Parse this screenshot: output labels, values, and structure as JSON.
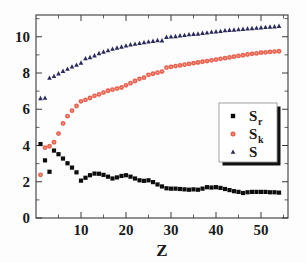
{
  "chart_data": {
    "type": "scatter",
    "title": "",
    "xlabel": "Z",
    "ylabel": "",
    "xlim": [
      0,
      56
    ],
    "ylim": [
      0,
      11.2
    ],
    "xticks": [
      10,
      20,
      30,
      40,
      50
    ],
    "yticks": [
      0,
      2,
      4,
      6,
      8,
      10
    ],
    "xtick_labels": [
      "10",
      "20",
      "30",
      "40",
      "50"
    ],
    "ytick_labels": [
      "0",
      "2",
      "4",
      "6",
      "8",
      "10"
    ],
    "grid": false,
    "legend_position": "center-right",
    "series": [
      {
        "name": "S_r",
        "label": "S",
        "sublabel": "r",
        "marker": "square",
        "color": "#0d0d0d",
        "x": [
          1,
          2,
          3,
          4,
          5,
          6,
          7,
          8,
          9,
          10,
          11,
          12,
          13,
          14,
          15,
          16,
          17,
          18,
          19,
          20,
          21,
          22,
          23,
          24,
          25,
          26,
          27,
          28,
          29,
          30,
          31,
          32,
          33,
          34,
          35,
          36,
          37,
          38,
          39,
          40,
          41,
          42,
          43,
          44,
          45,
          46,
          47,
          48,
          49,
          50,
          51,
          52,
          53,
          54
        ],
        "values": [
          4.08,
          3.18,
          2.55,
          3.72,
          3.52,
          3.28,
          3.02,
          2.78,
          2.52,
          2.06,
          2.22,
          2.36,
          2.45,
          2.44,
          2.38,
          2.28,
          2.18,
          2.24,
          2.32,
          2.36,
          2.28,
          2.18,
          2.08,
          2.05,
          2.08,
          1.98,
          1.85,
          1.74,
          1.64,
          1.62,
          1.62,
          1.6,
          1.58,
          1.56,
          1.58,
          1.56,
          1.62,
          1.7,
          1.68,
          1.7,
          1.66,
          1.6,
          1.54,
          1.48,
          1.44,
          1.38,
          1.42,
          1.44,
          1.44,
          1.44,
          1.44,
          1.42,
          1.42,
          1.4
        ]
      },
      {
        "name": "S_k",
        "label": "S",
        "sublabel": "k",
        "marker": "circle",
        "color": "#e8604c",
        "x": [
          1,
          2,
          3,
          4,
          5,
          6,
          7,
          8,
          9,
          10,
          11,
          12,
          13,
          14,
          15,
          16,
          17,
          18,
          19,
          20,
          21,
          22,
          23,
          24,
          25,
          26,
          27,
          28,
          29,
          30,
          31,
          32,
          33,
          34,
          35,
          36,
          37,
          38,
          39,
          40,
          41,
          42,
          43,
          44,
          45,
          46,
          47,
          48,
          49,
          50,
          51,
          52,
          53,
          54
        ],
        "values": [
          2.38,
          3.88,
          3.96,
          4.18,
          4.66,
          5.22,
          5.62,
          5.92,
          6.18,
          6.44,
          6.52,
          6.62,
          6.74,
          6.82,
          6.92,
          7.02,
          7.08,
          7.14,
          7.2,
          7.32,
          7.44,
          7.56,
          7.68,
          7.74,
          7.9,
          7.96,
          8.02,
          8.08,
          8.3,
          8.34,
          8.38,
          8.42,
          8.46,
          8.5,
          8.54,
          8.58,
          8.62,
          8.66,
          8.7,
          8.74,
          8.78,
          8.82,
          8.86,
          8.9,
          8.94,
          8.98,
          9.02,
          9.06,
          9.08,
          9.12,
          9.14,
          9.16,
          9.18,
          9.2
        ]
      },
      {
        "name": "S",
        "label": "S",
        "sublabel": "",
        "marker": "triangle",
        "color": "#2a2a5c",
        "x": [
          1,
          2,
          3,
          4,
          5,
          6,
          7,
          8,
          9,
          10,
          11,
          12,
          13,
          14,
          15,
          16,
          17,
          18,
          19,
          20,
          21,
          22,
          23,
          24,
          25,
          26,
          27,
          28,
          29,
          30,
          31,
          32,
          33,
          34,
          35,
          36,
          37,
          38,
          39,
          40,
          41,
          42,
          43,
          44,
          45,
          46,
          47,
          48,
          49,
          50,
          51,
          52,
          53,
          54
        ],
        "values": [
          6.6,
          6.62,
          7.72,
          7.82,
          7.96,
          8.1,
          8.22,
          8.34,
          8.44,
          8.56,
          8.8,
          8.86,
          8.96,
          9.08,
          9.16,
          9.24,
          9.32,
          9.38,
          9.44,
          9.5,
          9.56,
          9.6,
          9.64,
          9.68,
          9.72,
          9.76,
          9.8,
          9.78,
          9.98,
          10.0,
          10.02,
          10.06,
          10.08,
          10.12,
          10.14,
          10.16,
          10.2,
          10.22,
          10.26,
          10.28,
          10.3,
          10.34,
          10.36,
          10.38,
          10.4,
          10.42,
          10.44,
          10.46,
          10.48,
          10.5,
          10.52,
          10.54,
          10.56,
          10.58
        ]
      }
    ]
  },
  "legend": {
    "entries": [
      {
        "label": "S",
        "sublabel": "r",
        "marker": "square",
        "color": "#0d0d0d"
      },
      {
        "label": "S",
        "sublabel": "k",
        "marker": "circle",
        "color": "#e8604c"
      },
      {
        "label": "S",
        "sublabel": "",
        "marker": "triangle",
        "color": "#2a2a5c"
      }
    ]
  },
  "colors": {
    "series_sr": "#0d0d0d",
    "series_sk": "#e8604c",
    "series_s": "#2a2a5c",
    "axis": "#3a3a3a",
    "background": "#fdfdfd"
  }
}
